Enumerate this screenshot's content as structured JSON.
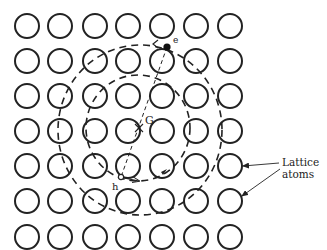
{
  "diagram": {
    "lattice": {
      "columns_x": [
        27,
        60,
        95,
        128,
        162,
        196,
        230
      ],
      "rows_y": [
        26,
        61,
        96,
        131,
        166,
        201,
        237
      ],
      "atom_radius": 12
    },
    "center_label": "G",
    "electron_label": "e",
    "hole_label": "h",
    "annotation": {
      "line1": "Lattice",
      "line2": "atoms"
    },
    "colors": {
      "stroke": "#222222",
      "background": "#ffffff"
    }
  }
}
